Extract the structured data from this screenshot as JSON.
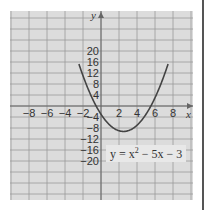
{
  "chart_data": {
    "type": "line",
    "title": "",
    "xlabel": "x",
    "ylabel": "y",
    "xlim": [
      -10,
      10
    ],
    "ylim": [
      -24,
      24
    ],
    "grid": true,
    "x_ticks": [
      -8,
      -6,
      -4,
      -2,
      2,
      4,
      6,
      8
    ],
    "y_ticks": [
      20,
      16,
      12,
      8,
      4,
      -4,
      -8,
      -12,
      -16,
      -20
    ],
    "series": [
      {
        "name": "y = x^2 - 5x - 3",
        "function": "x^2 - 5x - 3",
        "x": [
          -2.4,
          -2,
          -1,
          0,
          1,
          2,
          2.5,
          3,
          4,
          5,
          6,
          7,
          7.4
        ],
        "y": [
          14.76,
          11,
          3,
          -3,
          -7,
          -9,
          -9.25,
          -9,
          -7,
          -3,
          3,
          11,
          14.76
        ]
      }
    ],
    "annotations": [
      "y = x² − 5x − 3"
    ],
    "colors": {
      "curve": "#444444",
      "grid": "#9a9a9a",
      "background": "#dcdcdc"
    }
  },
  "labels": {
    "x_axis": "x",
    "y_axis": "y",
    "equation_lhs": "y = x",
    "equation_exp": "2",
    "equation_rhs": " − 5x − 3",
    "x_ticks": [
      "−8",
      "−6",
      "−4",
      "−2",
      "2",
      "4",
      "6",
      "8"
    ],
    "y_ticks": [
      "20",
      "16",
      "12",
      "8",
      "4",
      "−4",
      "−8",
      "−12",
      "−16",
      "−20"
    ]
  }
}
